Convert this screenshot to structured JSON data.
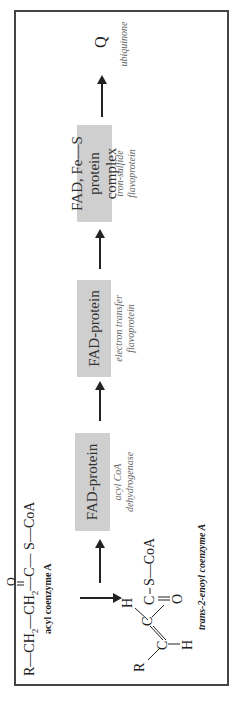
{
  "diagram": {
    "substrate": {
      "formula_parts": [
        "R—CH",
        "2",
        "—CH",
        "2",
        "—C—",
        "S—CoA"
      ],
      "carbonyl_o": "O",
      "label": "acyl coenzyme A"
    },
    "product": {
      "atoms": {
        "R": "R",
        "C1": "C",
        "C2": "C",
        "H_top": "H",
        "H_bottom": "H",
        "C3": "C",
        "O": "O",
        "SCoA": "S—CoA"
      },
      "label": "trans-2-enoyl coenzyme A"
    },
    "steps": [
      {
        "box_lines": [
          "FAD-protein"
        ],
        "caption_lines": [
          "acyl CoA",
          "dehydrogenase"
        ]
      },
      {
        "box_lines": [
          "FAD-protein"
        ],
        "caption_lines": [
          "electron transfer",
          "flavoprotein"
        ]
      },
      {
        "box_lines": [
          "FAD, Fe—S",
          "protein complex"
        ],
        "caption_lines": [
          "iron-sulfide",
          "flavoprotein"
        ]
      }
    ],
    "acceptor": {
      "symbol": "Q",
      "label": "ubiquinone"
    },
    "colors": {
      "box_fill": "#cfcfcf",
      "frame": "#444444",
      "caption": "#666666"
    }
  }
}
